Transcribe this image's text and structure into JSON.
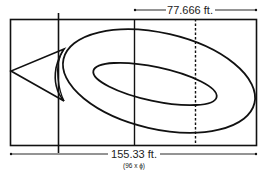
{
  "diagram": {
    "top_dimension": {
      "label": "77.666 ft."
    },
    "bottom_dimension": {
      "label": "155.33 ft.",
      "sublabel": "(96 x ϕ)"
    }
  },
  "colors": {
    "stroke": "#111111",
    "background": "#ffffff"
  }
}
